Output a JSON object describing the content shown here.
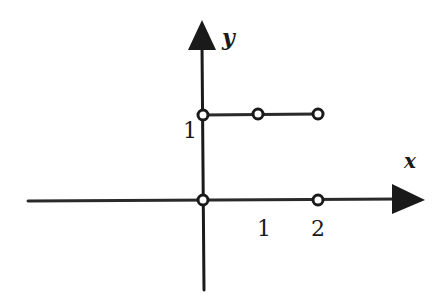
{
  "diagram": {
    "type": "step-function-graph",
    "axes": {
      "x_label": "x",
      "y_label": "y",
      "x_ticks": [
        "1",
        "2"
      ],
      "y_ticks": [
        "1"
      ]
    },
    "segments": [
      {
        "from": [
          0,
          1
        ],
        "to": [
          2,
          1
        ],
        "description": "horizontal segment at y=1"
      },
      {
        "from": [
          0,
          0
        ],
        "to": [
          2,
          0
        ],
        "description": "segment along x-axis at y=0"
      }
    ],
    "open_points": [
      {
        "x": 0,
        "y": 1
      },
      {
        "x": 1,
        "y": 1
      },
      {
        "x": 2,
        "y": 1
      },
      {
        "x": 0,
        "y": 0
      },
      {
        "x": 2,
        "y": 0
      }
    ],
    "colors": {
      "ink": "#1a1a1a",
      "background": "#ffffff"
    }
  }
}
